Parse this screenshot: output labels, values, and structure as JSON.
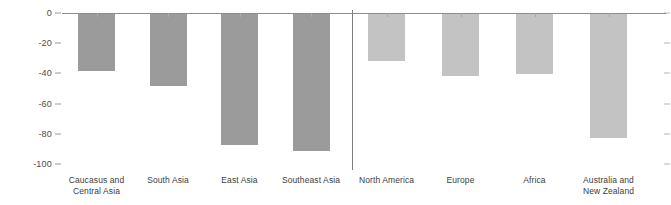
{
  "chart_data": {
    "type": "bar",
    "title": "",
    "subtitle": "",
    "xlabel": "",
    "ylabel": "",
    "ylim": [
      -100,
      0
    ],
    "yticks": [
      0,
      -20,
      -40,
      -60,
      -80,
      -100
    ],
    "ytick_labels": [
      "0",
      "-20",
      "-40",
      "-60",
      "-80",
      "-100"
    ],
    "grid": false,
    "legend": "none",
    "orientation": "vertical",
    "baseline": 0,
    "groups": [
      {
        "name": "group-left",
        "color": "#9b9b9b",
        "categories": [
          "Caucasus and Central Asia",
          "South Asia",
          "East Asia",
          "Southeast Asia"
        ],
        "values": [
          -38,
          -48,
          -87,
          "-91"
        ]
      },
      {
        "name": "group-right",
        "color": "#c3c3c3",
        "categories": [
          "North America",
          "Europe",
          "Africa",
          "Australia and New Zealand"
        ],
        "values": [
          -31,
          -41,
          -40,
          -82
        ]
      }
    ],
    "categories": [
      "Caucasus and Central Asia",
      "South Asia",
      "East Asia",
      "Southeast Asia",
      "North America",
      "Europe",
      "Africa",
      "Australia and New Zealand"
    ],
    "values": [
      -38,
      -48,
      -87,
      -91,
      -31,
      -41,
      -40,
      -82
    ],
    "bar_colors": [
      "#9b9b9b",
      "#9b9b9b",
      "#9b9b9b",
      "#9b9b9b",
      "#c3c3c3",
      "#c3c3c3",
      "#c3c3c3",
      "#c3c3c3"
    ],
    "divider_after_index": 3
  },
  "axis": {
    "y_ticks": [
      {
        "label": "0",
        "value": 0
      },
      {
        "label": "-20",
        "value": -20
      },
      {
        "label": "-40",
        "value": -40
      },
      {
        "label": "-60",
        "value": -60
      },
      {
        "label": "-80",
        "value": -80
      },
      {
        "label": "-100",
        "value": -100
      }
    ]
  },
  "x_labels": [
    {
      "line1": "Caucasus and",
      "line2": "Central Asia"
    },
    {
      "line1": "South Asia",
      "line2": ""
    },
    {
      "line1": "East Asia",
      "line2": ""
    },
    {
      "line1": "Southeast Asia",
      "line2": ""
    },
    {
      "line1": "North America",
      "line2": ""
    },
    {
      "line1": "Europe",
      "line2": ""
    },
    {
      "line1": "Africa",
      "line2": ""
    },
    {
      "line1": "Australia and",
      "line2": "New Zealand"
    }
  ],
  "colors": {
    "bar_dark": "#9b9b9b",
    "bar_light": "#c3c3c3",
    "axis_line": "#8c8c8c",
    "divider": "#7d7d7d",
    "tick_text": "#4a4a4a",
    "label_text": "#3d3d3d",
    "background": "#ffffff"
  }
}
